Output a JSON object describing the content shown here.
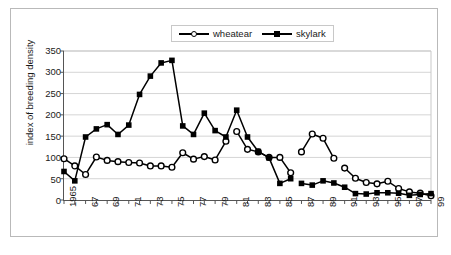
{
  "chart_data": {
    "type": "line",
    "title": "",
    "xlabel": "",
    "ylabel": "index of breeding density",
    "ylim": [
      0,
      350
    ],
    "ytick_step": 50,
    "yticks": [
      "350",
      "300",
      "250",
      "200",
      "150",
      "100",
      "50",
      "0"
    ],
    "grid": "horizontal",
    "legend_position": "top-center",
    "x": [
      1965,
      1966,
      1967,
      1968,
      1969,
      1970,
      1971,
      1972,
      1973,
      1974,
      1975,
      1976,
      1977,
      1978,
      1979,
      1980,
      1981,
      1982,
      1983,
      1984,
      1985,
      1986,
      1987,
      1988,
      1989,
      1990,
      1991,
      1992,
      1993,
      1994,
      1995,
      1996,
      1997,
      1998,
      1999
    ],
    "xtick_labels": [
      "1965",
      "",
      "67",
      "",
      "69",
      "",
      "71",
      "",
      "73",
      "",
      "75",
      "",
      "77",
      "",
      "79",
      "",
      "81",
      "",
      "83",
      "",
      "85",
      "",
      "87",
      "",
      "89",
      "",
      "91",
      "",
      "93",
      "",
      "95",
      "",
      "97",
      "",
      "99"
    ],
    "xlim": [
      1965,
      1999
    ],
    "series": [
      {
        "name": "wheatear",
        "marker": "open-circle",
        "color": "#000000",
        "values": [
          97,
          80,
          60,
          101,
          93,
          90,
          88,
          87,
          80,
          80,
          77,
          111,
          96,
          102,
          94,
          138,
          161,
          119,
          113,
          100,
          100,
          64,
          113,
          155,
          145,
          98,
          75,
          51,
          41,
          38,
          44,
          27,
          19,
          16,
          10
        ],
        "breaks_after_x": [
          1980,
          1986,
          1990
        ]
      },
      {
        "name": "skylark",
        "marker": "filled-square",
        "color": "#000000",
        "values": [
          67,
          45,
          148,
          167,
          177,
          154,
          176,
          248,
          291,
          322,
          328,
          174,
          154,
          204,
          163,
          148,
          211,
          148,
          114,
          99,
          39,
          50,
          39,
          35,
          45,
          40,
          30,
          15,
          14,
          17,
          17,
          16,
          11,
          13,
          15
        ],
        "breaks_after_x": [
          1986
        ]
      }
    ]
  },
  "legend": {
    "entries": [
      {
        "label": "wheatear",
        "marker": "open-circle"
      },
      {
        "label": "skylark",
        "marker": "filled-square"
      }
    ]
  },
  "axes": {
    "y_title": "index of breeding density"
  }
}
